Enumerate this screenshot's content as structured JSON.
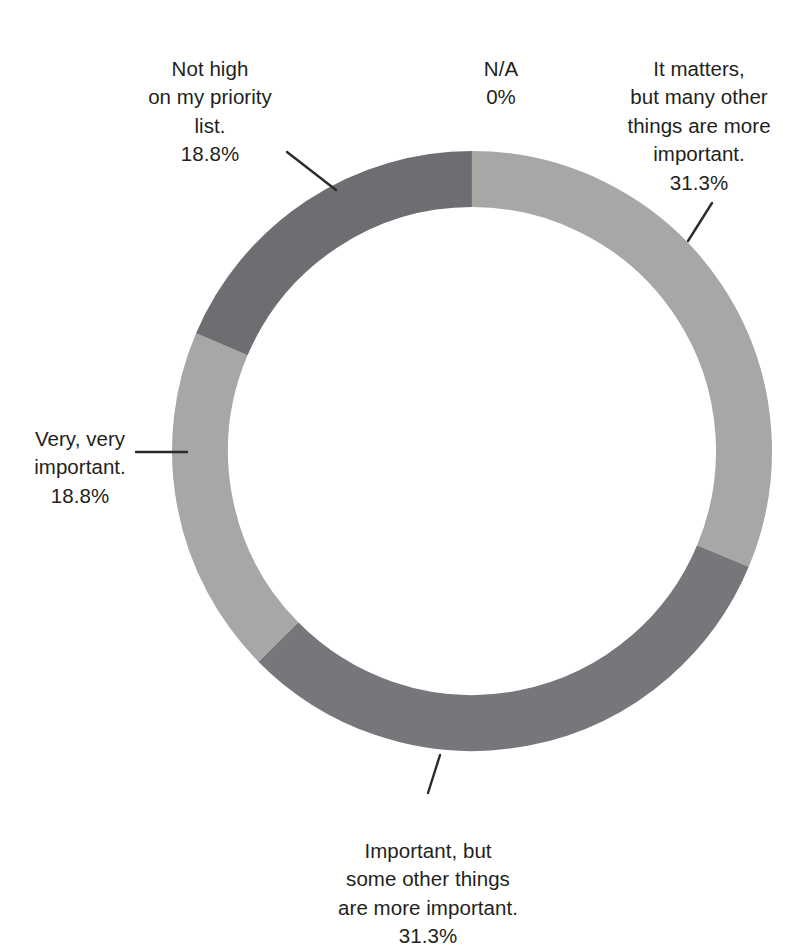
{
  "chart_data": {
    "type": "pie",
    "variant": "donut",
    "title": "",
    "title_clipped_partial": true,
    "xlabel": "",
    "ylabel": "",
    "legend": "none",
    "grid": false,
    "labels_position": "outside-with-leader-lines",
    "categories": [
      "It matters, but many other things are more important.",
      "Important, but some other things are more important.",
      "Very, very important.",
      "Not high on my priority list.",
      "N/A"
    ],
    "values": [
      31.3,
      31.3,
      18.8,
      18.8,
      0
    ],
    "value_labels": [
      "31.3%",
      "31.3%",
      "18.8%",
      "18.8%",
      "0%"
    ],
    "colors": [
      "#a8a7a5",
      "#77767a",
      "#a8a7a5",
      "#6f6d71",
      "#ffffff"
    ],
    "units": "percent",
    "total": 100.2,
    "start_angle_deg": 0,
    "direction": "clockwise",
    "inner_radius_ratio": 0.813
  },
  "chart": {
    "center_x": 472,
    "center_y": 451,
    "outer_radius": 300,
    "inner_radius": 244,
    "segments": [
      {
        "id": "it-matters",
        "name": "It matters, but many other things are more important.",
        "percent_label": "31.3%",
        "value": 31.3,
        "color": "#a8a7a5",
        "start_deg": 0,
        "end_deg": 112.7
      },
      {
        "id": "important-but",
        "name": "Important, but some other things are more important.",
        "percent_label": "31.3%",
        "value": 31.3,
        "color": "#77767a",
        "start_deg": 112.7,
        "end_deg": 225.4
      },
      {
        "id": "very-very",
        "name": "Very, very important.",
        "percent_label": "18.8%",
        "value": 18.8,
        "color": "#a8a7a5",
        "start_deg": 225.4,
        "end_deg": 293.1
      },
      {
        "id": "not-high",
        "name": "Not high on my priority list.",
        "percent_label": "18.8%",
        "value": 18.8,
        "color": "#6f6d71",
        "start_deg": 293.1,
        "end_deg": 360
      }
    ]
  },
  "labels": {
    "not_high": {
      "text": "Not high\non my priority\nlist.",
      "percent": "18.8%"
    },
    "na": {
      "text": "N/A",
      "percent": "0%"
    },
    "it_matters": {
      "text": "It matters,\nbut many other\nthings are more\nimportant.",
      "percent": "31.3%"
    },
    "very_very": {
      "text": "Very, very\nimportant.",
      "percent": "18.8%"
    },
    "important_but": {
      "text": "Important, but\nsome other things\nare more important.",
      "percent": "31.3%"
    }
  },
  "colors": {
    "text": "#231f20",
    "leader_line": "#2b2b2b",
    "background": "#ffffff",
    "segment_light": "#a8a7a5",
    "segment_dark": "#77767a",
    "segment_dark_alt": "#6f6d71"
  }
}
